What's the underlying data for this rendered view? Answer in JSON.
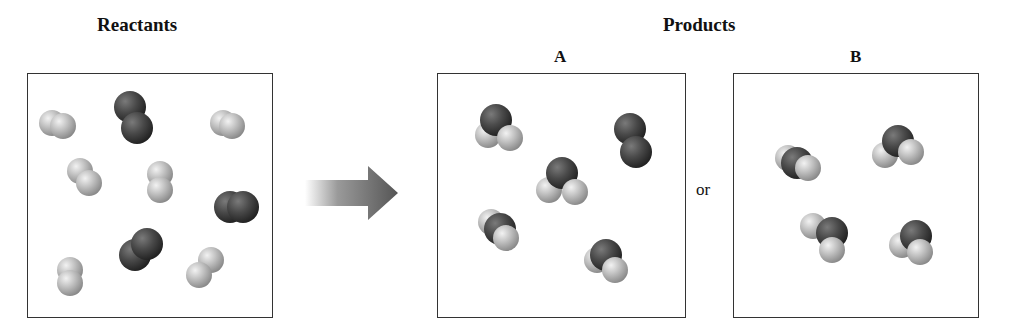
{
  "reactants": {
    "title": "Reactants",
    "box": {
      "x": 27,
      "y": 73,
      "w": 246,
      "h": 245
    },
    "molecules": [
      {
        "kind": "H2",
        "atoms": [
          [
            52,
            123,
            "H"
          ],
          [
            63,
            126,
            "H"
          ]
        ]
      },
      {
        "kind": "O2",
        "atoms": [
          [
            130,
            107,
            "O"
          ],
          [
            137,
            128,
            "O"
          ]
        ]
      },
      {
        "kind": "H2",
        "atoms": [
          [
            223,
            123,
            "H"
          ],
          [
            232,
            126,
            "H"
          ]
        ]
      },
      {
        "kind": "H2",
        "atoms": [
          [
            80,
            171,
            "H"
          ],
          [
            89,
            183,
            "H"
          ]
        ]
      },
      {
        "kind": "H2",
        "atoms": [
          [
            160,
            174,
            "H"
          ],
          [
            160,
            190,
            "H"
          ]
        ]
      },
      {
        "kind": "O2",
        "atoms": [
          [
            230,
            207,
            "O"
          ],
          [
            243,
            207,
            "O"
          ]
        ]
      },
      {
        "kind": "O2",
        "atoms": [
          [
            135,
            255,
            "O"
          ],
          [
            147,
            244,
            "O"
          ]
        ]
      },
      {
        "kind": "H2",
        "atoms": [
          [
            70,
            270,
            "H"
          ],
          [
            70,
            283,
            "H"
          ]
        ]
      },
      {
        "kind": "H2",
        "atoms": [
          [
            211,
            260,
            "H"
          ],
          [
            199,
            275,
            "H"
          ]
        ]
      }
    ]
  },
  "arrow": {
    "from_x": 305,
    "to_x": 400,
    "y": 193
  },
  "products": {
    "title": "Products",
    "options": [
      {
        "id": "A",
        "label": "A",
        "box": {
          "x": 437,
          "y": 73,
          "w": 249,
          "h": 245
        },
        "molecules": [
          {
            "kind": "H2O",
            "atoms": [
              [
                496,
                120,
                "O"
              ],
              [
                488,
                135,
                "H"
              ],
              [
                510,
                138,
                "H"
              ]
            ]
          },
          {
            "kind": "O2",
            "atoms": [
              [
                630,
                129,
                "O"
              ],
              [
                636,
                152,
                "O"
              ]
            ]
          },
          {
            "kind": "H2O",
            "atoms": [
              [
                562,
                173,
                "O"
              ],
              [
                549,
                190,
                "H"
              ],
              [
                575,
                192,
                "H"
              ]
            ]
          },
          {
            "kind": "H2O",
            "atoms": [
              [
                500,
                229,
                "O"
              ],
              [
                491,
                222,
                "H"
              ],
              [
                506,
                238,
                "H"
              ]
            ]
          },
          {
            "kind": "H2O",
            "atoms": [
              [
                606,
                255,
                "O"
              ],
              [
                597,
                260,
                "H"
              ],
              [
                615,
                270,
                "H"
              ]
            ]
          }
        ]
      },
      {
        "id": "B",
        "label": "B",
        "box": {
          "x": 733,
          "y": 73,
          "w": 246,
          "h": 245
        },
        "molecules": [
          {
            "kind": "H2O",
            "atoms": [
              [
                797,
                163,
                "O"
              ],
              [
                788,
                158,
                "H"
              ],
              [
                808,
                168,
                "H"
              ]
            ]
          },
          {
            "kind": "H2O",
            "atoms": [
              [
                898,
                141,
                "O"
              ],
              [
                885,
                155,
                "H"
              ],
              [
                911,
                152,
                "H"
              ]
            ]
          },
          {
            "kind": "H2O",
            "atoms": [
              [
                832,
                233,
                "O"
              ],
              [
                813,
                226,
                "H"
              ],
              [
                832,
                250,
                "H"
              ]
            ]
          },
          {
            "kind": "H2O",
            "atoms": [
              [
                916,
                236,
                "O"
              ],
              [
                902,
                245,
                "H"
              ],
              [
                920,
                252,
                "H"
              ]
            ]
          }
        ]
      }
    ],
    "or_text": "or"
  },
  "colors": {
    "hydrogen": "#c8c8c8",
    "oxygen": "#4a4a4a",
    "border": "#333333",
    "arrow": "#555555"
  }
}
